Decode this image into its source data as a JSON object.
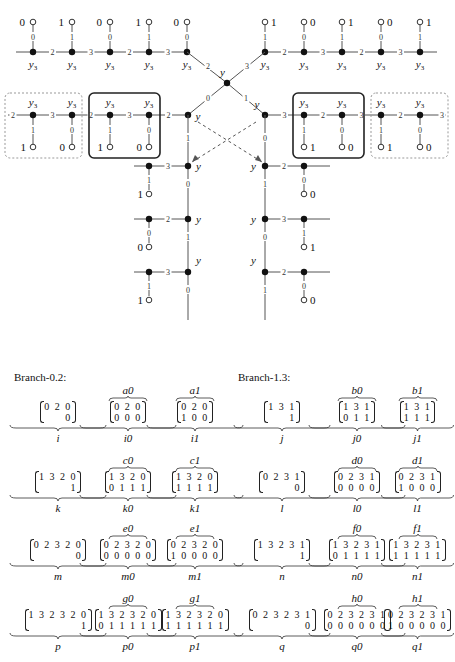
{
  "diagram": {
    "node_label": "y",
    "y3_label": "y",
    "y3_sub": "3",
    "top_left_chain": {
      "edges": [
        "2",
        "3",
        "2",
        "3"
      ],
      "stems": [
        "0",
        "1",
        "0",
        "1",
        "0"
      ],
      "leaves": [
        "0",
        "1",
        "0",
        "1",
        "0"
      ]
    },
    "top_right_chain": {
      "edges": [
        "2",
        "3",
        "2",
        "3"
      ],
      "stems": [
        "1",
        "0",
        "1",
        "0",
        "1"
      ],
      "leaves": [
        "1",
        "0",
        "1",
        "0",
        "1"
      ]
    },
    "center_edges": {
      "upper_left": "2",
      "upper_right": "3",
      "lower_left": "0",
      "lower_right": "1"
    },
    "mid_left_chain": {
      "edges": [
        "2",
        "3",
        "2",
        "3",
        "2"
      ],
      "stems": [
        "1",
        "0",
        "1",
        "0"
      ],
      "leaves": [
        "1",
        "0",
        "1",
        "0"
      ]
    },
    "mid_right_chain": {
      "edges": [
        "3",
        "2",
        "3",
        "2",
        "3"
      ],
      "stems": [
        "1",
        "0",
        "1",
        "0"
      ],
      "leaves": [
        "1",
        "0",
        "1",
        "0"
      ]
    },
    "left_column": {
      "trunk_labels": [
        "1",
        "0",
        "1",
        "0"
      ],
      "rungs": [
        {
          "edge": "3",
          "stem": "1",
          "leaf": "1"
        },
        {
          "edge": "2",
          "stem": "0",
          "leaf": "0"
        },
        {
          "edge": "3",
          "stem": "1",
          "leaf": "1"
        }
      ]
    },
    "right_column": {
      "trunk_labels": [
        "0",
        "1",
        "0",
        "1"
      ],
      "rungs": [
        {
          "edge": "2",
          "stem": "0",
          "leaf": "0"
        },
        {
          "edge": "3",
          "stem": "1",
          "leaf": "1"
        },
        {
          "edge": "2",
          "stem": "0",
          "leaf": "0"
        }
      ]
    }
  },
  "branch_left": {
    "title": "Branch-0.2:",
    "rows": [
      {
        "items": [
          {
            "top": "",
            "lines": [
              "0 2 0",
              "0"
            ],
            "name": "i"
          },
          {
            "top": "a0",
            "lines": [
              "0 2 0",
              "0 0 0"
            ],
            "name": "i0"
          },
          {
            "top": "a1",
            "lines": [
              "0 2 0",
              "1 0 0"
            ],
            "name": "i1"
          }
        ]
      },
      {
        "items": [
          {
            "top": "",
            "lines": [
              "1 3 2 0",
              "1"
            ],
            "name": "k"
          },
          {
            "top": "c0",
            "lines": [
              "1 3 2 0",
              "0 1 1 1"
            ],
            "name": "k0"
          },
          {
            "top": "c1",
            "lines": [
              "1 3 2 0",
              "1 1 1 1"
            ],
            "name": "k1"
          }
        ]
      },
      {
        "items": [
          {
            "top": "",
            "lines": [
              "0 2 3 2 0",
              "0"
            ],
            "name": "m"
          },
          {
            "top": "e0",
            "lines": [
              "0 2 3 2 0",
              "0 0 0 0 0"
            ],
            "name": "m0"
          },
          {
            "top": "e1",
            "lines": [
              "0 2 3 2 0",
              "1 0 0 0 0"
            ],
            "name": "m1"
          }
        ]
      },
      {
        "items": [
          {
            "top": "",
            "lines": [
              "1 3 2 3 2 0",
              "1"
            ],
            "name": "p"
          },
          {
            "top": "g0",
            "lines": [
              "1 3 2 3 2 0",
              "0 1 1 1 1 1"
            ],
            "name": "p0"
          },
          {
            "top": "g1",
            "lines": [
              "1 3 2 3 2 0",
              "1 1 1 1 1 1"
            ],
            "name": "p1"
          }
        ]
      }
    ]
  },
  "branch_right": {
    "title": "Branch-1.3:",
    "rows": [
      {
        "items": [
          {
            "top": "",
            "lines": [
              "1 3 1",
              "1"
            ],
            "name": "j"
          },
          {
            "top": "b0",
            "lines": [
              "1 3 1",
              "0 1 1"
            ],
            "name": "j0"
          },
          {
            "top": "b1",
            "lines": [
              "1 3 1",
              "1 1 1"
            ],
            "name": "j1"
          }
        ]
      },
      {
        "items": [
          {
            "top": "",
            "lines": [
              "0 2 3 1",
              "0"
            ],
            "name": "l"
          },
          {
            "top": "d0",
            "lines": [
              "0 2 3 1",
              "0 0 0 0"
            ],
            "name": "l0"
          },
          {
            "top": "d1",
            "lines": [
              "0 2 3 1",
              "1 0 0 0"
            ],
            "name": "l1"
          }
        ]
      },
      {
        "items": [
          {
            "top": "",
            "lines": [
              "1 3 2 3 1",
              "1"
            ],
            "name": "n"
          },
          {
            "top": "f0",
            "lines": [
              "1 3 2 3 1",
              "0 1 1 1 1"
            ],
            "name": "n0"
          },
          {
            "top": "f1",
            "lines": [
              "1 3 2 3 1",
              "1 1 1 1 1"
            ],
            "name": "n1"
          }
        ]
      },
      {
        "items": [
          {
            "top": "",
            "lines": [
              "0 2 3 2 3 1",
              "0"
            ],
            "name": "q"
          },
          {
            "top": "h0",
            "lines": [
              "0 2 3 2 3 1",
              "0 0 0 0 0 0"
            ],
            "name": "q0"
          },
          {
            "top": "h1",
            "lines": [
              "0 2 3 2 3 1",
              "1 0 0 0 0 0"
            ],
            "name": "q1"
          }
        ]
      }
    ]
  }
}
